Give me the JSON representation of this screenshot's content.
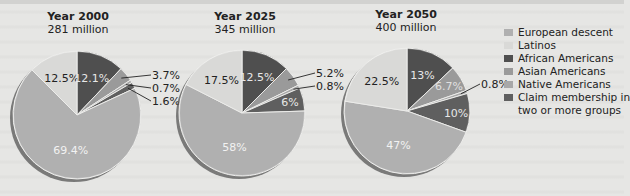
{
  "chart_data": {
    "type": "pie",
    "legend_position": "right",
    "legend": [
      {
        "name": "European descent",
        "color": "#b0b0b0"
      },
      {
        "name": "Latinos",
        "color": "#d9d9d7"
      },
      {
        "name": "African Americans",
        "color": "#4f4f4f"
      },
      {
        "name": "Asian Americans",
        "color": "#9a9a9a"
      },
      {
        "name": "Native Americans",
        "color": "#a8a8a8"
      },
      {
        "name": "Claim membership in two or more groups",
        "color": "#5f5f5f"
      }
    ],
    "charts": [
      {
        "title": "Year 2000",
        "subtitle": "281 million",
        "values": [
          69.4,
          12.5,
          12.1,
          3.7,
          0.7,
          1.6
        ],
        "labels": [
          "69.4%",
          "12.5%",
          "12.1%",
          "3.7%",
          "0.7%",
          "1.6%"
        ]
      },
      {
        "title": "Year 2025",
        "subtitle": "345 million",
        "values": [
          58,
          17.5,
          12.5,
          5.2,
          0.8,
          6
        ],
        "labels": [
          "58%",
          "17.5%",
          "12.5%",
          "5.2%",
          "0.8%",
          "6%"
        ]
      },
      {
        "title": "Year 2050",
        "subtitle": "400 million",
        "values": [
          47,
          22.5,
          13,
          6.7,
          0.8,
          10
        ],
        "labels": [
          "47%",
          "22.5%",
          "13%",
          "6.7%",
          "0.8%",
          "10%"
        ]
      }
    ]
  },
  "legend": {
    "items": [
      "European descent",
      "Latinos",
      "African Americans",
      "Asian Americans",
      "Native Americans",
      "Claim membership in",
      "two or more groups"
    ]
  },
  "headers": [
    {
      "year": "Year 2000",
      "pop": "281 million"
    },
    {
      "year": "Year 2025",
      "pop": "345 million"
    },
    {
      "year": "Year 2050",
      "pop": "400 million"
    }
  ]
}
